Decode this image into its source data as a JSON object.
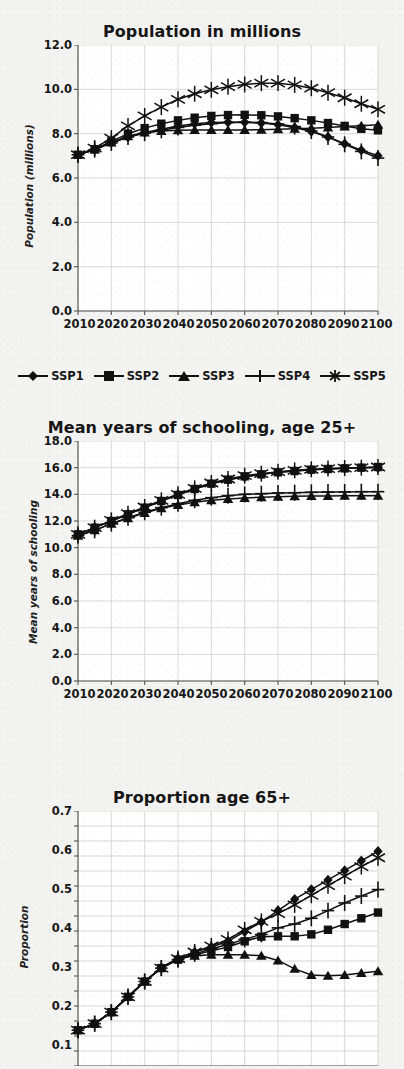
{
  "page": {
    "background_color": "#f3f3f1",
    "ink_color": "#111111",
    "grid_color": "#cfcfcf"
  },
  "legend": {
    "position": "below-chart-1",
    "entries": [
      {
        "label": "SSP1",
        "marker": "diamond"
      },
      {
        "label": "SSP2",
        "marker": "square"
      },
      {
        "label": "SSP3",
        "marker": "triangle"
      },
      {
        "label": "SSP4",
        "marker": "plus"
      },
      {
        "label": "SSP5",
        "marker": "asterisk"
      }
    ]
  },
  "chart_data": [
    {
      "id": "population",
      "type": "line",
      "title": "Population in millions",
      "xlabel": "",
      "ylabel": "Population (millions)",
      "x": [
        2010,
        2015,
        2020,
        2025,
        2030,
        2035,
        2040,
        2045,
        2050,
        2055,
        2060,
        2065,
        2070,
        2075,
        2080,
        2085,
        2090,
        2095,
        2100
      ],
      "xtick_labels": [
        "2010",
        "2020",
        "2030",
        "2040",
        "2050",
        "2060",
        "2070",
        "2080",
        "2090",
        "2100"
      ],
      "ytick_labels": [
        "0.0",
        "2.0",
        "4.0",
        "6.0",
        "8.0",
        "10.0",
        "12.0"
      ],
      "ylim": [
        0.0,
        12.0
      ],
      "xlim": [
        2010,
        2100
      ],
      "grid": true,
      "legend_position": "bottom",
      "series": [
        {
          "name": "SSP1",
          "marker": "diamond",
          "values": [
            7.05,
            7.3,
            7.6,
            7.85,
            8.05,
            8.2,
            8.35,
            8.45,
            8.5,
            8.52,
            8.52,
            8.48,
            8.4,
            8.28,
            8.1,
            7.85,
            7.55,
            7.25,
            7.0
          ]
        },
        {
          "name": "SSP2",
          "marker": "square",
          "values": [
            7.05,
            7.3,
            7.65,
            8.0,
            8.25,
            8.45,
            8.6,
            8.72,
            8.8,
            8.84,
            8.85,
            8.83,
            8.78,
            8.7,
            8.6,
            8.48,
            8.35,
            8.22,
            8.15
          ]
        },
        {
          "name": "SSP3",
          "marker": "triangle",
          "values": [
            7.05,
            7.28,
            7.6,
            7.88,
            8.05,
            8.12,
            8.15,
            8.16,
            8.16,
            8.16,
            8.17,
            8.18,
            8.2,
            8.22,
            8.25,
            8.28,
            8.32,
            8.36,
            8.4
          ]
        },
        {
          "name": "SSP4",
          "marker": "plus",
          "values": [
            7.05,
            7.28,
            7.58,
            7.85,
            8.02,
            8.15,
            8.28,
            8.38,
            8.45,
            8.5,
            8.52,
            8.5,
            8.44,
            8.32,
            8.12,
            7.85,
            7.52,
            7.2,
            6.9
          ]
        },
        {
          "name": "SSP5",
          "marker": "asterisk",
          "values": [
            7.05,
            7.35,
            7.8,
            8.35,
            8.8,
            9.2,
            9.55,
            9.8,
            9.98,
            10.12,
            10.22,
            10.28,
            10.28,
            10.2,
            10.05,
            9.85,
            9.62,
            9.35,
            9.1
          ]
        }
      ]
    },
    {
      "id": "schooling",
      "type": "line",
      "title": "Mean years of schooling, age 25+",
      "xlabel": "",
      "ylabel": "Mean years of schooling",
      "x": [
        2010,
        2015,
        2020,
        2025,
        2030,
        2035,
        2040,
        2045,
        2050,
        2055,
        2060,
        2065,
        2070,
        2075,
        2080,
        2085,
        2090,
        2095,
        2100
      ],
      "xtick_labels": [
        "2010",
        "2020",
        "2030",
        "2040",
        "2050",
        "2060",
        "2070",
        "2080",
        "2090",
        "2100"
      ],
      "ytick_labels": [
        "0.0",
        "2.0",
        "4.0",
        "6.0",
        "8.0",
        "10.0",
        "12.0",
        "14.0",
        "16.0",
        "18.0"
      ],
      "ylim": [
        0.0,
        18.0
      ],
      "xlim": [
        2010,
        2100
      ],
      "grid": true,
      "legend_position": "none",
      "series": [
        {
          "name": "SSP1",
          "marker": "diamond",
          "values": [
            11.0,
            11.5,
            12.0,
            12.5,
            13.0,
            13.5,
            14.0,
            14.4,
            14.8,
            15.1,
            15.3,
            15.5,
            15.65,
            15.75,
            15.85,
            15.9,
            15.95,
            16.0,
            16.0
          ]
        },
        {
          "name": "SSP2",
          "marker": "square",
          "values": [
            11.0,
            11.5,
            12.0,
            12.5,
            13.0,
            13.5,
            13.95,
            14.4,
            14.8,
            15.1,
            15.35,
            15.5,
            15.65,
            15.75,
            15.85,
            15.9,
            15.95,
            16.0,
            16.05
          ]
        },
        {
          "name": "SSP3",
          "marker": "triangle",
          "values": [
            10.9,
            11.3,
            11.8,
            12.2,
            12.6,
            12.95,
            13.2,
            13.4,
            13.55,
            13.65,
            13.72,
            13.78,
            13.82,
            13.85,
            13.87,
            13.88,
            13.89,
            13.9,
            13.9
          ]
        },
        {
          "name": "SSP4",
          "marker": "plus",
          "values": [
            10.9,
            11.3,
            11.8,
            12.25,
            12.65,
            13.0,
            13.3,
            13.55,
            13.75,
            13.9,
            14.0,
            14.05,
            14.1,
            14.12,
            14.15,
            14.17,
            14.18,
            14.2,
            14.2
          ]
        },
        {
          "name": "SSP5",
          "marker": "asterisk",
          "values": [
            11.0,
            11.5,
            12.05,
            12.55,
            13.05,
            13.55,
            14.0,
            14.45,
            14.85,
            15.15,
            15.4,
            15.55,
            15.7,
            15.8,
            15.88,
            15.93,
            15.97,
            16.0,
            16.05
          ]
        }
      ]
    },
    {
      "id": "proportion65",
      "type": "line",
      "title": "Proportion age 65+",
      "xlabel": "",
      "ylabel": "Proportion",
      "x": [
        2010,
        2015,
        2020,
        2025,
        2030,
        2035,
        2040,
        2045,
        2050,
        2055,
        2060,
        2065,
        2070,
        2075,
        2080,
        2085,
        2090,
        2095,
        2100
      ],
      "xtick_labels": [],
      "ytick_labels": [
        "0.1",
        "0.2",
        "0.3",
        "0.4",
        "0.5",
        "0.6",
        "0.7"
      ],
      "ylim": [
        0.08,
        0.7
      ],
      "xlim": [
        2010,
        2100
      ],
      "grid": true,
      "legend_position": "none",
      "cropped_bottom": true,
      "series": [
        {
          "name": "SSP1",
          "marker": "diamond",
          "values": [
            0.128,
            0.145,
            0.175,
            0.215,
            0.255,
            0.29,
            0.315,
            0.332,
            0.345,
            0.36,
            0.385,
            0.41,
            0.44,
            0.47,
            0.495,
            0.52,
            0.545,
            0.57,
            0.595
          ]
        },
        {
          "name": "SSP2",
          "marker": "square",
          "values": [
            0.128,
            0.145,
            0.175,
            0.215,
            0.255,
            0.29,
            0.312,
            0.325,
            0.335,
            0.345,
            0.36,
            0.372,
            0.373,
            0.373,
            0.378,
            0.39,
            0.405,
            0.42,
            0.435
          ]
        },
        {
          "name": "SSP3",
          "marker": "triangle",
          "values": [
            0.128,
            0.145,
            0.175,
            0.215,
            0.255,
            0.292,
            0.315,
            0.322,
            0.325,
            0.325,
            0.325,
            0.322,
            0.31,
            0.288,
            0.272,
            0.27,
            0.272,
            0.277,
            0.282
          ]
        },
        {
          "name": "SSP4",
          "marker": "plus",
          "values": [
            0.128,
            0.145,
            0.175,
            0.215,
            0.255,
            0.29,
            0.312,
            0.327,
            0.34,
            0.352,
            0.365,
            0.378,
            0.395,
            0.405,
            0.42,
            0.44,
            0.46,
            0.478,
            0.495
          ]
        },
        {
          "name": "SSP5",
          "marker": "asterisk",
          "values": [
            0.128,
            0.145,
            0.175,
            0.215,
            0.255,
            0.29,
            0.315,
            0.332,
            0.348,
            0.365,
            0.39,
            0.412,
            0.432,
            0.455,
            0.48,
            0.505,
            0.53,
            0.555,
            0.578
          ]
        }
      ]
    }
  ]
}
